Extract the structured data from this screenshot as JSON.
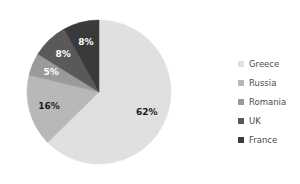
{
  "chart_data": {
    "type": "pie",
    "title": "",
    "categories": [
      "Greece",
      "Russia",
      "Romania",
      "UK",
      "France"
    ],
    "values": [
      62,
      16,
      5,
      8,
      8
    ],
    "unit": "%",
    "data_labels": [
      "62%",
      "16%",
      "5%",
      "8%",
      "8%"
    ],
    "colors": [
      "#e0e0e0",
      "#b8b8b8",
      "#9a9a9a",
      "#595959",
      "#3a3a3a"
    ],
    "label_text_colors": [
      "#1a1a1a",
      "#1a1a1a",
      "#ffffff",
      "#ffffff",
      "#ffffff"
    ],
    "start_angle_deg": 0,
    "direction": "clockwise",
    "legend": {
      "position": "right",
      "entries": [
        {
          "label": "Greece",
          "color": "#e0e0e0",
          "value": 62
        },
        {
          "label": "Russia",
          "color": "#b8b8b8",
          "value": 16
        },
        {
          "label": "Romania",
          "color": "#9a9a9a",
          "value": 5
        },
        {
          "label": "UK",
          "color": "#595959",
          "value": 8
        },
        {
          "label": "France",
          "color": "#3a3a3a",
          "value": 8
        }
      ]
    },
    "grid": false,
    "xlabel": "",
    "ylabel": ""
  },
  "geometry": {
    "cx": 81,
    "cy": 80,
    "r": 72,
    "label_radius_factor": 0.72
  }
}
